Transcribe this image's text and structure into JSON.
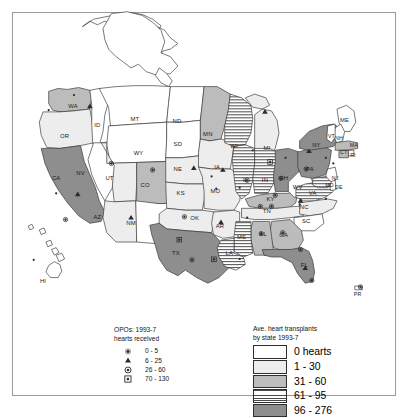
{
  "figure": {
    "kind": "choropleth-map",
    "region": "United States"
  },
  "legend_opo": {
    "title_line1": "OPOs:  1993-7",
    "title_line2": "hearts received",
    "items": [
      {
        "symbol": "dot",
        "icon": "dot-icon",
        "label": "0 - 5"
      },
      {
        "symbol": "triangle",
        "icon": "triangle-icon",
        "label": "6 - 25"
      },
      {
        "symbol": "circled-dot",
        "icon": "circled-dot-icon",
        "label": "26 - 60"
      },
      {
        "symbol": "boxed-dot",
        "icon": "boxed-dot-icon",
        "label": "70 - 130"
      }
    ]
  },
  "legend_choropleth": {
    "title_line1": "Ave. heart transplants",
    "title_line2": "by state 1993-7",
    "classes": [
      {
        "label": "0 hearts",
        "swatch": "c0",
        "color": "#ffffff",
        "pattern": "solid"
      },
      {
        "label": "1 - 30",
        "swatch": "c1",
        "color": "#ededed",
        "pattern": "solid"
      },
      {
        "label": "31 - 60",
        "swatch": "c2",
        "color": "#bcbcbc",
        "pattern": "solid"
      },
      {
        "label": "61 - 95",
        "swatch": "c3",
        "color": "#ffffff",
        "pattern": "horizontal-lines"
      },
      {
        "label": "96 - 276",
        "swatch": "c4",
        "color": "#8e8e8e",
        "pattern": "solid"
      }
    ]
  },
  "chart_data": {
    "type": "map",
    "title": "Ave. heart transplants by state 1993-7",
    "value_unit": "average hearts transplanted",
    "class_breaks": [
      "0",
      "1 - 30",
      "31 - 60",
      "61 - 95",
      "96 - 276"
    ],
    "states": [
      {
        "code": "WA",
        "class": 2
      },
      {
        "code": "OR",
        "class": 1
      },
      {
        "code": "CA",
        "class": 4
      },
      {
        "code": "NV",
        "class": 0
      },
      {
        "code": "ID",
        "class": 0
      },
      {
        "code": "MT",
        "class": 0
      },
      {
        "code": "WY",
        "class": 0
      },
      {
        "code": "UT",
        "class": 1
      },
      {
        "code": "AZ",
        "class": 1
      },
      {
        "code": "CO",
        "class": 2
      },
      {
        "code": "NM",
        "class": 0
      },
      {
        "code": "ND",
        "class": 0
      },
      {
        "code": "SD",
        "class": 0
      },
      {
        "code": "NE",
        "class": 1
      },
      {
        "code": "KS",
        "class": 1
      },
      {
        "code": "OK",
        "class": 1
      },
      {
        "code": "TX",
        "class": 4
      },
      {
        "code": "MN",
        "class": 2
      },
      {
        "code": "IA",
        "class": 1
      },
      {
        "code": "MO",
        "class": 1
      },
      {
        "code": "AR",
        "class": 1
      },
      {
        "code": "LA",
        "class": 3
      },
      {
        "code": "MS",
        "class": 3
      },
      {
        "code": "WI",
        "class": 3
      },
      {
        "code": "IL",
        "class": 3
      },
      {
        "code": "IN",
        "class": 3
      },
      {
        "code": "MI",
        "class": 1
      },
      {
        "code": "OH",
        "class": 4
      },
      {
        "code": "KY",
        "class": 2
      },
      {
        "code": "TN",
        "class": 1
      },
      {
        "code": "AL",
        "class": 2
      },
      {
        "code": "GA",
        "class": 2
      },
      {
        "code": "FL",
        "class": 4
      },
      {
        "code": "SC",
        "class": 0
      },
      {
        "code": "NC",
        "class": 1
      },
      {
        "code": "VA",
        "class": 3
      },
      {
        "code": "WV",
        "class": 0
      },
      {
        "code": "PA",
        "class": 4
      },
      {
        "code": "NY",
        "class": 4
      },
      {
        "code": "ME",
        "class": 0
      },
      {
        "code": "NH",
        "class": 0
      },
      {
        "code": "VT",
        "class": 0
      },
      {
        "code": "MA",
        "class": 2
      },
      {
        "code": "RI",
        "class": 0
      },
      {
        "code": "CT",
        "class": 2
      },
      {
        "code": "NJ",
        "class": 0
      },
      {
        "code": "DE",
        "class": 0
      },
      {
        "code": "MD",
        "class": 3
      },
      {
        "code": "AK",
        "class": 0
      },
      {
        "code": "HI",
        "class": 0
      }
    ]
  },
  "map_labels": {
    "states": [
      {
        "code": "WA",
        "x": 78,
        "y": 113
      },
      {
        "code": "OR",
        "x": 69,
        "y": 145
      },
      {
        "code": "ID",
        "x": 104,
        "y": 133
      },
      {
        "code": "MT",
        "x": 144,
        "y": 127
      },
      {
        "code": "ND",
        "x": 189,
        "y": 129
      },
      {
        "code": "SD",
        "x": 190,
        "y": 154
      },
      {
        "code": "MN",
        "x": 222,
        "y": 143
      },
      {
        "code": "WI",
        "x": 250,
        "y": 156
      },
      {
        "code": "MI",
        "x": 285,
        "y": 158
      },
      {
        "code": "WY",
        "x": 148,
        "y": 163
      },
      {
        "code": "CA",
        "x": 60,
        "y": 190
      },
      {
        "code": "NV",
        "x": 86,
        "y": 185
      },
      {
        "code": "UT",
        "x": 117,
        "y": 190
      },
      {
        "code": "CO",
        "x": 155,
        "y": 198
      },
      {
        "code": "NE",
        "x": 190,
        "y": 181
      },
      {
        "code": "IA",
        "x": 232,
        "y": 178
      },
      {
        "code": "IL",
        "x": 262,
        "y": 192
      },
      {
        "code": "IN",
        "x": 283,
        "y": 192
      },
      {
        "code": "OH",
        "x": 303,
        "y": 190
      },
      {
        "code": "PA",
        "x": 331,
        "y": 180
      },
      {
        "code": "NY",
        "x": 338,
        "y": 155
      },
      {
        "code": "ME",
        "x": 368,
        "y": 128
      },
      {
        "code": "NH",
        "x": 362,
        "y": 148
      },
      {
        "code": "VT",
        "x": 354,
        "y": 145
      },
      {
        "code": "MA",
        "x": 378,
        "y": 155
      },
      {
        "code": "RI",
        "x": 377,
        "y": 166
      },
      {
        "code": "CT",
        "x": 367,
        "y": 163
      },
      {
        "code": "NJ",
        "x": 358,
        "y": 190
      },
      {
        "code": "DE",
        "x": 362,
        "y": 200
      },
      {
        "code": "MD",
        "x": 352,
        "y": 198
      },
      {
        "code": "WV",
        "x": 318,
        "y": 200
      },
      {
        "code": "VA",
        "x": 334,
        "y": 206
      },
      {
        "code": "KS",
        "x": 193,
        "y": 206
      },
      {
        "code": "MO",
        "x": 230,
        "y": 204
      },
      {
        "code": "KY",
        "x": 289,
        "y": 212
      },
      {
        "code": "TN",
        "x": 285,
        "y": 225
      },
      {
        "code": "NC",
        "x": 325,
        "y": 221
      },
      {
        "code": "SC",
        "x": 327,
        "y": 236
      },
      {
        "code": "AZ",
        "x": 104,
        "y": 232
      },
      {
        "code": "NM",
        "x": 140,
        "y": 238
      },
      {
        "code": "OK",
        "x": 208,
        "y": 233
      },
      {
        "code": "AR",
        "x": 235,
        "y": 241
      },
      {
        "code": "MS",
        "x": 258,
        "y": 253
      },
      {
        "code": "AL",
        "x": 281,
        "y": 250
      },
      {
        "code": "GA",
        "x": 303,
        "y": 251
      },
      {
        "code": "TX",
        "x": 188,
        "y": 270
      },
      {
        "code": "LA",
        "x": 245,
        "y": 270
      },
      {
        "code": "FL",
        "x": 325,
        "y": 283
      },
      {
        "code": "HI",
        "x": 46,
        "y": 300
      },
      {
        "code": "PR",
        "x": 382,
        "y": 314
      }
    ]
  }
}
